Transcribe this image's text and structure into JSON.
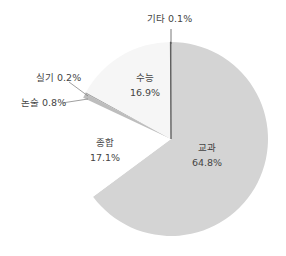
{
  "chart_data": {
    "type": "pie",
    "title": "",
    "categories": [
      "교과",
      "종합",
      "논술",
      "실기",
      "수능",
      "기타"
    ],
    "values": [
      64.8,
      17.1,
      0.8,
      0.2,
      16.9,
      0.1
    ],
    "unit": "%",
    "start_angle": "12 o'clock",
    "direction": "clockwise",
    "colors": [
      "#d4d4d4",
      "#ffffff",
      "#bdbdbd",
      "#a9a9a9",
      "#f6f6f6",
      "#555555"
    ],
    "labels": [
      {
        "name": "교과",
        "value": "64.8%"
      },
      {
        "name": "종합",
        "value": "17.1%"
      },
      {
        "name": "논술",
        "value": "0.8%"
      },
      {
        "name": "실기",
        "value": "0.2%"
      },
      {
        "name": "수능",
        "value": "16.9%"
      },
      {
        "name": "기타",
        "value": "0.1%"
      }
    ],
    "legend": "none (inline labels with leader lines for small slices)"
  },
  "labels": {
    "gyogwa": {
      "name": "교과",
      "value": "64.8%"
    },
    "jonghap": {
      "name": "종합",
      "value": "17.1%"
    },
    "suneung": {
      "name": "수능",
      "value": "16.9%"
    },
    "nonsul": {
      "text": "논술 0.8%"
    },
    "silgi": {
      "text": "실기 0.2%"
    },
    "gita": {
      "text": "기타 0.1%"
    }
  }
}
